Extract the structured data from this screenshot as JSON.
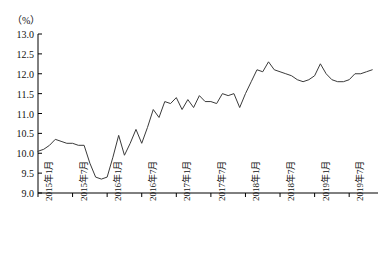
{
  "chart_data": {
    "type": "line",
    "title": "",
    "subtitle": "",
    "unit_label": "（%）",
    "xlabel": "",
    "ylabel": "",
    "ylim": [
      9.0,
      13.0
    ],
    "ytick_labels": [
      "13.0",
      "12.5",
      "12.0",
      "11.5",
      "11.0",
      "10.5",
      "10.0",
      "9.5",
      "9.0"
    ],
    "ytick_values": [
      13.0,
      12.5,
      12.0,
      11.5,
      11.0,
      10.5,
      10.0,
      9.5,
      9.0
    ],
    "grid": false,
    "legend": "none",
    "xtick_labels": [
      "2015年1月",
      "2015年7月",
      "2016年1月",
      "2016年7月",
      "2017年1月",
      "2017年7月",
      "2018年1月",
      "2018年7月",
      "2019年1月",
      "2019年7月"
    ],
    "xtick_indices": [
      0,
      6,
      12,
      18,
      24,
      30,
      36,
      42,
      48,
      54
    ],
    "x": [
      "2015年1月",
      "2015年2月",
      "2015年3月",
      "2015年4月",
      "2015年5月",
      "2015年6月",
      "2015年7月",
      "2015年8月",
      "2015年9月",
      "2015年10月",
      "2015年11月",
      "2015年12月",
      "2016年1月",
      "2016年2月",
      "2016年3月",
      "2016年4月",
      "2016年5月",
      "2016年6月",
      "2016年7月",
      "2016年8月",
      "2016年9月",
      "2016年10月",
      "2016年11月",
      "2016年12月",
      "2017年1月",
      "2017年2月",
      "2017年3月",
      "2017年4月",
      "2017年5月",
      "2017年6月",
      "2017年7月",
      "2017年8月",
      "2017年9月",
      "2017年10月",
      "2017年11月",
      "2017年12月",
      "2018年1月",
      "2018年2月",
      "2018年3月",
      "2018年4月",
      "2018年5月",
      "2018年6月",
      "2018年7月",
      "2018年8月",
      "2018年9月",
      "2018年10月",
      "2018年11月",
      "2018年12月",
      "2019年1月",
      "2019年2月",
      "2019年3月",
      "2019年4月",
      "2019年5月",
      "2019年6月",
      "2019年7月",
      "2019年8月",
      "2019年9月",
      "2019年10月",
      "2019年11月"
    ],
    "values": [
      10.05,
      10.1,
      10.2,
      10.35,
      10.3,
      10.25,
      10.25,
      10.2,
      10.2,
      9.75,
      9.4,
      9.35,
      9.4,
      9.9,
      10.45,
      9.95,
      10.25,
      10.6,
      10.25,
      10.65,
      11.1,
      10.9,
      11.3,
      11.25,
      11.4,
      11.1,
      11.35,
      11.15,
      11.45,
      11.3,
      11.3,
      11.25,
      11.5,
      11.45,
      11.5,
      11.15,
      11.5,
      11.8,
      12.1,
      12.05,
      12.3,
      12.1,
      12.05,
      12.0,
      11.95,
      11.85,
      11.8,
      11.85,
      11.95,
      12.25,
      12.0,
      11.85,
      11.8,
      11.8,
      11.85,
      12.0,
      12.0,
      12.05,
      12.1
    ],
    "line_color": "#3a3a3a",
    "axis_color": "#000000"
  }
}
